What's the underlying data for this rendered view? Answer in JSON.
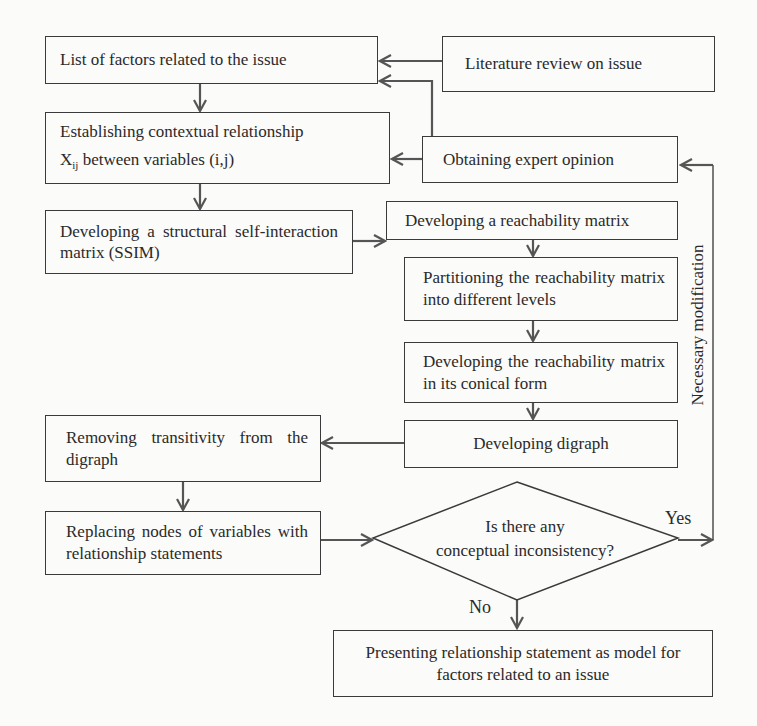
{
  "diagram": {
    "type": "flowchart",
    "title": "",
    "colors": {
      "line": "#3a3a3a",
      "arrow": "#555555",
      "background": "#fbfbfa",
      "text": "#2a2a2a"
    },
    "nodes": {
      "list_factors": {
        "label": "List of factors related to the issue"
      },
      "literature_review": {
        "label": "Literature review on issue"
      },
      "contextual_relationship": {
        "label_line1": "Establishing contextual relationship",
        "label_line2_prefix": "X",
        "label_line2_sub": "ij",
        "label_line2_suffix": " between variables (i,j)"
      },
      "expert_opinion": {
        "label": "Obtaining expert opinion"
      },
      "ssim": {
        "label": "Developing a structural self-interaction matrix (SSIM)"
      },
      "reachability_matrix": {
        "label": "Developing a reachability matrix"
      },
      "partitioning": {
        "label": "Partitioning the reachability matrix into different levels"
      },
      "conical_form": {
        "label": "Developing the reachability matrix in its conical form"
      },
      "digraph": {
        "label": "Developing digraph"
      },
      "remove_transitivity": {
        "label": "Removing transitivity from the digraph"
      },
      "replace_nodes": {
        "label": "Replacing nodes of variables with relationship statements"
      },
      "decision": {
        "label_line1": "Is there any",
        "label_line2": "conceptual inconsistency?"
      },
      "present_model": {
        "label_line1": "Presenting relationship statement as model for",
        "label_line2": "factors related to an issue"
      }
    },
    "edge_labels": {
      "yes": "Yes",
      "no": "No",
      "feedback": "Necessary modification"
    },
    "edges": [
      {
        "from": "literature_review",
        "to": "list_factors"
      },
      {
        "from": "expert_opinion",
        "to": "list_factors"
      },
      {
        "from": "list_factors",
        "to": "contextual_relationship"
      },
      {
        "from": "expert_opinion",
        "to": "contextual_relationship"
      },
      {
        "from": "contextual_relationship",
        "to": "ssim"
      },
      {
        "from": "ssim",
        "to": "reachability_matrix"
      },
      {
        "from": "reachability_matrix",
        "to": "partitioning"
      },
      {
        "from": "partitioning",
        "to": "conical_form"
      },
      {
        "from": "conical_form",
        "to": "digraph"
      },
      {
        "from": "digraph",
        "to": "remove_transitivity"
      },
      {
        "from": "remove_transitivity",
        "to": "replace_nodes"
      },
      {
        "from": "replace_nodes",
        "to": "decision"
      },
      {
        "from": "decision",
        "to": "expert_opinion",
        "label": "Yes / Necessary modification"
      },
      {
        "from": "decision",
        "to": "present_model",
        "label": "No"
      }
    ]
  }
}
